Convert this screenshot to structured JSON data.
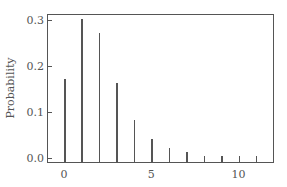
{
  "chart_data": {
    "type": "bar",
    "title": "",
    "xlabel": "",
    "ylabel": "Probability",
    "categories": [
      0,
      1,
      2,
      3,
      4,
      5,
      6,
      7,
      8,
      9,
      10,
      11
    ],
    "values": [
      0.17,
      0.3,
      0.27,
      0.16,
      0.08,
      0.04,
      0.02,
      0.01,
      0.003,
      0.003,
      0.003,
      0.003
    ],
    "xlim": [
      -1,
      12
    ],
    "ylim": [
      -0.013,
      0.31
    ],
    "xticks": [
      "0",
      "5",
      "10"
    ],
    "yticks": [
      "0.0",
      "0.1",
      "0.2",
      "0.3"
    ],
    "grid": false,
    "style": "stem"
  },
  "colors": {
    "bar": "#555555",
    "axis": "#555555"
  }
}
